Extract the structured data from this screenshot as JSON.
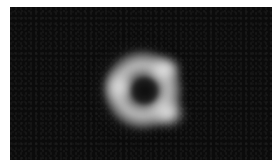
{
  "image": {
    "description": "Grayscale astronomical image of a glowing ring with a dark central shadow and three bright knots, on a dark noisy background",
    "subject": "ring-shaped emission with central dark shadow",
    "colors": {
      "background": "#0b0b0b",
      "border": "#ffffff",
      "ring": "#c8c8c8",
      "highlight": "#ffffff",
      "center": "#141414"
    },
    "features": [
      {
        "name": "bright-knot-upper-right",
        "x": 155,
        "y": 63
      },
      {
        "name": "bright-knot-left",
        "x": 112,
        "y": 80
      },
      {
        "name": "bright-knot-lower-right",
        "x": 158,
        "y": 107
      },
      {
        "name": "central-shadow",
        "x": 135,
        "y": 84
      }
    ]
  }
}
